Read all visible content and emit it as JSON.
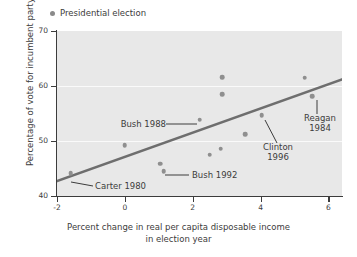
{
  "legend": {
    "marker_name": "legend-dot",
    "label": "Presidential election",
    "position": "top-left"
  },
  "axis_titles": {
    "y": "Percentage of vote for incumbent party",
    "x_line1": "Percent change in real per capita disposable income",
    "x_line2": "in election year"
  },
  "colors": {
    "plot_background": "#e8e8e8",
    "point": "#8f8f8f",
    "trendline": "#6e6e6e",
    "gridline": "#fafafa",
    "axis": "#3c3c3c",
    "text": "#3c3c3c"
  },
  "annotations": [
    {
      "name": "annotation-bush-1988",
      "line1": "Bush 1988",
      "line2": ""
    },
    {
      "name": "annotation-bush-1992",
      "line1": "Bush 1992",
      "line2": ""
    },
    {
      "name": "annotation-carter-1980",
      "line1": "Carter 1980",
      "line2": ""
    },
    {
      "name": "annotation-clinton-1996",
      "line1": "Clinton",
      "line2": "1996"
    },
    {
      "name": "annotation-reagan-1984",
      "line1": "Reagan",
      "line2": "1984"
    }
  ],
  "chart_data": {
    "type": "scatter",
    "title": "",
    "xlabel": "Percent change in real per capita disposable income in election year",
    "ylabel": "Percentage of vote for incumbent party",
    "xlim": [
      -2,
      6.4
    ],
    "ylim": [
      40,
      70
    ],
    "xticks": [
      -2,
      0,
      2,
      4,
      6
    ],
    "xtick_labels": [
      "-2",
      "0",
      "2",
      "4",
      "6"
    ],
    "yticks": [
      40,
      50,
      60,
      70
    ],
    "ytick_labels": [
      "40",
      "50",
      "60",
      "70"
    ],
    "grid": "horizontal-white-at-50-and-60",
    "legend_position": "above-plot-left",
    "series": [
      {
        "name": "Presidential election",
        "marker": "circle",
        "points": [
          {
            "x": -1.6,
            "y": 44.1,
            "label": "Carter 1980"
          },
          {
            "x": 0.0,
            "y": 49.2,
            "label": ""
          },
          {
            "x": 1.05,
            "y": 45.9,
            "label": "Bush 1992"
          },
          {
            "x": 1.15,
            "y": 44.5,
            "label": ""
          },
          {
            "x": 2.2,
            "y": 53.9,
            "label": "Bush 1988"
          },
          {
            "x": 2.5,
            "y": 47.5,
            "label": ""
          },
          {
            "x": 2.82,
            "y": 48.6,
            "label": ""
          },
          {
            "x": 2.87,
            "y": 61.6,
            "label": ""
          },
          {
            "x": 2.87,
            "y": 58.5,
            "label": ""
          },
          {
            "x": 3.55,
            "y": 51.2,
            "label": ""
          },
          {
            "x": 4.03,
            "y": 54.7,
            "label": "Clinton 1996"
          },
          {
            "x": 5.3,
            "y": 61.5,
            "label": ""
          },
          {
            "x": 5.52,
            "y": 58.1,
            "label": "Reagan 1984"
          }
        ]
      }
    ],
    "trendline": {
      "type": "linear-fit",
      "x_start": -2.0,
      "y_start": 42.7,
      "x_end": 6.4,
      "y_end": 61.2
    }
  }
}
